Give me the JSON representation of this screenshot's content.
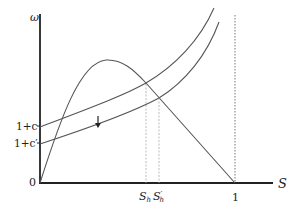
{
  "diagram": {
    "y_axis_label": "ω",
    "x_axis_label": "S",
    "origin_label": "0",
    "y_ticks": [
      {
        "label": "1+c",
        "y": 126
      },
      {
        "label": "1+c′",
        "y": 143
      }
    ],
    "x_ticks": [
      {
        "label": "1",
        "x": 235
      }
    ],
    "intersection_labels": {
      "s_h": {
        "main": "S",
        "sub": "h"
      },
      "s_h_prime": {
        "main": "S",
        "sup": "′",
        "sub": "h"
      }
    },
    "shift_arrow": "down",
    "curves": [
      {
        "name": "hump-curve",
        "description": "rises from origin, peaks, then declines linearly to S=1"
      },
      {
        "name": "upper-cost-curve",
        "description": "convex increasing curve starting at 1+c"
      },
      {
        "name": "lower-cost-curve",
        "description": "convex increasing curve starting at 1+c′"
      }
    ]
  }
}
